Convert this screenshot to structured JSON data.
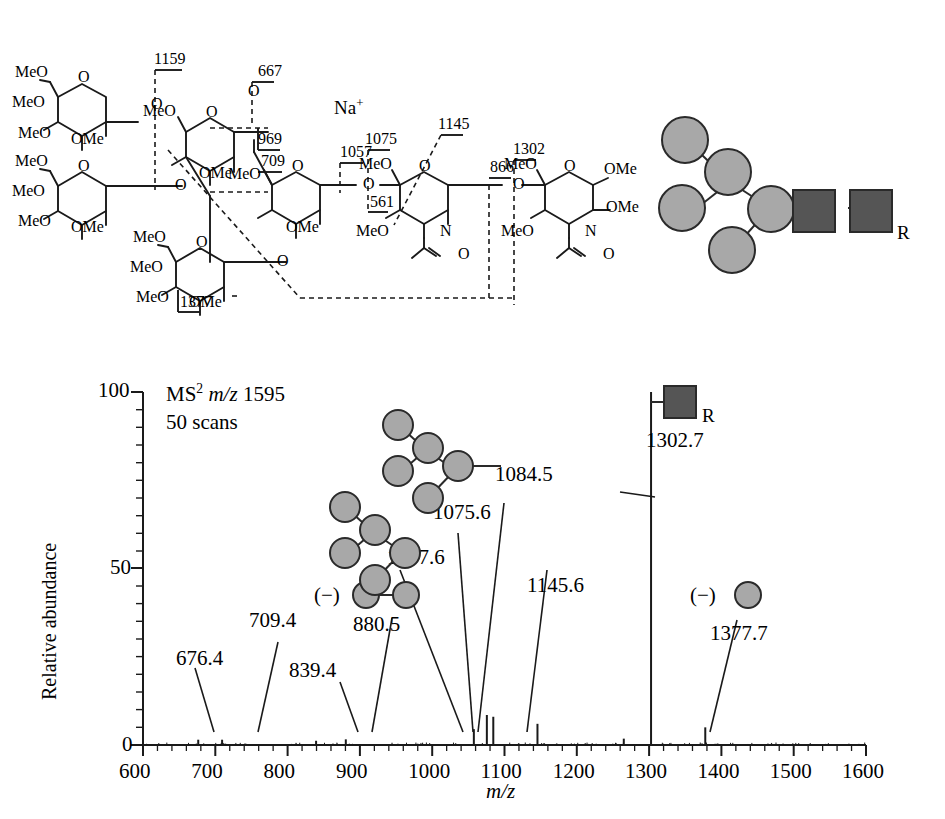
{
  "figure": {
    "title_block": [
      "MS2 m/z 1595",
      "50 scans"
    ],
    "ms_label_main": "MS",
    "ms_label_sup": "2",
    "ms_label_mz": "m/z",
    "ms_label_value": "1595",
    "scans_label": "50 scans",
    "r_group_label": "R"
  },
  "structure": {
    "sodium_adduct": "Na",
    "sodium_charge": "+",
    "substituent_labels": [
      "MeO",
      "OMe",
      "O",
      "N",
      "R"
    ],
    "fragment_labels": [
      {
        "id": "f1159",
        "text": "1159"
      },
      {
        "id": "f667",
        "text": "667"
      },
      {
        "id": "f969",
        "text": "969"
      },
      {
        "id": "f709",
        "text": "709"
      },
      {
        "id": "f1057",
        "text": "1057"
      },
      {
        "id": "f1075",
        "text": "1075"
      },
      {
        "id": "f561",
        "text": "561"
      },
      {
        "id": "f1145",
        "text": "1145"
      },
      {
        "id": "f866",
        "text": "866"
      },
      {
        "id": "f1302",
        "text": "1302"
      },
      {
        "id": "f1377",
        "text": "1377"
      }
    ],
    "ring_substituents": {
      "meo": "MeO",
      "ome": "OMe",
      "o": "O",
      "n": "N"
    }
  },
  "cartoon": {
    "description": "glycan cartoon: 5 shaded circles (hexose) linked to 2 dark squares (HexNAc) with R terminus",
    "circle_color": "#a8a8a8",
    "square_color": "#555555",
    "r_label": "R",
    "n_circles": 5,
    "n_squares": 2
  },
  "chart_data": {
    "type": "line",
    "xlabel": "m/z",
    "ylabel": "Relative abundance",
    "xlim": [
      600,
      1600
    ],
    "ylim": [
      0,
      100
    ],
    "xticks": [
      600,
      700,
      800,
      900,
      1000,
      1100,
      1200,
      1300,
      1400,
      1500,
      1600
    ],
    "xtick_labels": [
      "600",
      "700",
      "800",
      "900",
      "1000",
      "1100",
      "1200",
      "1300",
      "1400",
      "1500",
      "1600"
    ],
    "yticks": [
      0,
      50,
      100
    ],
    "ytick_labels": [
      "0",
      "50",
      "100"
    ],
    "minor_tick_interval_x": 20,
    "minor_tick_interval_y": 5,
    "grid": false,
    "legend": false,
    "peaks": [
      {
        "mz": 676.4,
        "intensity": 1.5
      },
      {
        "mz": 709.4,
        "intensity": 1.5
      },
      {
        "mz": 839.4,
        "intensity": 1.2
      },
      {
        "mz": 880.5,
        "intensity": 1.6
      },
      {
        "mz": 1057.6,
        "intensity": 4.5
      },
      {
        "mz": 1075.6,
        "intensity": 8.5
      },
      {
        "mz": 1084.5,
        "intensity": 8.0
      },
      {
        "mz": 1145.6,
        "intensity": 6.0
      },
      {
        "mz": 1265.0,
        "intensity": 1.8
      },
      {
        "mz": 1302.7,
        "intensity": 100.0
      },
      {
        "mz": 1377.7,
        "intensity": 5.0
      }
    ],
    "annotations": [
      {
        "label": "676.4",
        "mz": 676.4
      },
      {
        "label": "709.4",
        "mz": 709.4
      },
      {
        "label": "839.4",
        "mz": 839.4
      },
      {
        "label": "880.5",
        "mz": 880.5
      },
      {
        "label": "1057.6",
        "mz": 1057.6
      },
      {
        "label": "1075.6",
        "mz": 1075.6
      },
      {
        "label": "1084.5",
        "mz": 1084.5
      },
      {
        "label": "1145.6",
        "mz": 1145.6
      },
      {
        "label": "1302.7",
        "mz": 1302.7
      },
      {
        "label": "1377.7",
        "mz": 1377.7
      }
    ],
    "inline_symbols": [
      {
        "label": "(−)",
        "near": "880.5"
      },
      {
        "label": "(−)",
        "near": "1377.7"
      }
    ]
  },
  "axis": {
    "x_title": "m/z",
    "y_title": "Relative abundance",
    "y_top": "100",
    "y_mid": "50",
    "y_bottom": "0"
  }
}
